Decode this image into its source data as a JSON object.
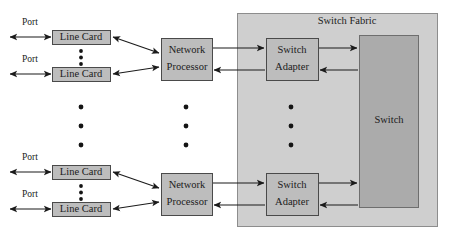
{
  "diagram": {
    "colors": {
      "fabric_fill": "#cfcfcf",
      "box_fill": "#bdbdbd",
      "switch_fill": "#ababab",
      "stroke": "#1b1b1b",
      "background": "#ffffff",
      "text": "#1b1b1b"
    },
    "fabric": {
      "label": "Switch Fabric"
    },
    "switch": {
      "label": "Switch"
    },
    "ports": [
      {
        "label": "Port"
      },
      {
        "label": "Port"
      },
      {
        "label": "Port"
      },
      {
        "label": "Port"
      }
    ],
    "line_cards": [
      {
        "label": "Line Card"
      },
      {
        "label": "Line Card"
      },
      {
        "label": "Line Card"
      },
      {
        "label": "Line Card"
      }
    ],
    "network_processors": [
      {
        "label_line1": "Network",
        "label_line2": "Processor"
      },
      {
        "label_line1": "Network",
        "label_line2": "Processor"
      }
    ],
    "switch_adapters": [
      {
        "label_line1": "Switch",
        "label_line2": "Adapter"
      },
      {
        "label_line1": "Switch",
        "label_line2": "Adapter"
      }
    ],
    "ellipses": [
      {
        "name": "line-card-group-1-ellipsis",
        "dots": 3
      },
      {
        "name": "line-card-column-ellipsis",
        "dots": 3
      },
      {
        "name": "line-card-group-2-ellipsis",
        "dots": 3
      },
      {
        "name": "network-processor-column-ellipsis",
        "dots": 3
      },
      {
        "name": "switch-adapter-column-ellipsis",
        "dots": 3
      }
    ]
  }
}
